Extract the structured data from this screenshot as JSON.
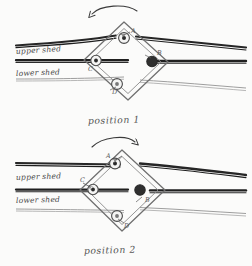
{
  "document": {
    "kind": "hand-drawn-diagram",
    "medium": "pencil on paper",
    "paper_color": "#fbfbfa",
    "ink_color": "#2b2b2b",
    "pencil_color": "#6d6d6d"
  },
  "diagrams": [
    {
      "id": "position-1",
      "caption": "position 1",
      "rotation_hint": "counterclockwise",
      "labels": {
        "upper_shed": "upper shed",
        "lower_shed": "lower shed"
      },
      "points": [
        {
          "id": "A",
          "label": "A",
          "role": "top-corner-pulley"
        },
        {
          "id": "B",
          "label": "B",
          "role": "right-corner-pulley"
        },
        {
          "id": "C",
          "label": "C",
          "role": "left-corner-pulley"
        },
        {
          "id": "D",
          "label": "D",
          "role": "bottom-corner-pulley"
        }
      ]
    },
    {
      "id": "position-2",
      "caption": "position 2",
      "rotation_hint": "clockwise",
      "labels": {
        "upper_shed": "upper shed",
        "lower_shed": "lower shed"
      },
      "points": [
        {
          "id": "A",
          "label": "A",
          "role": "top-corner-pulley"
        },
        {
          "id": "B",
          "label": "B",
          "role": "right-corner-pulley"
        },
        {
          "id": "C",
          "label": "C",
          "role": "left-corner-pulley"
        },
        {
          "id": "D",
          "label": "D",
          "role": "bottom-corner-pulley"
        }
      ]
    }
  ]
}
